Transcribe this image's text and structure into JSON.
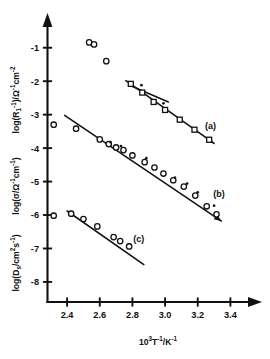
{
  "figure": {
    "title": "",
    "background": "#ffffff",
    "ink_color": "#111111"
  },
  "xaxis": {
    "label_parts": {
      "base1": "10",
      "exp1": "3",
      "base2": "T",
      "exp2": "-1",
      "slash": "/K",
      "exp3": "-1"
    },
    "label_plain": "10^3 T^-1 / K^-1",
    "ticks": [
      "2.4",
      "2.6",
      "2.8",
      "3.0",
      "3.2",
      "3.4"
    ],
    "tick_values": [
      2.4,
      2.6,
      2.8,
      3.0,
      3.2,
      3.4
    ],
    "range": [
      2.28,
      3.52
    ],
    "arrow": true
  },
  "yaxis": {
    "ticks": [
      "-1",
      "-2",
      "-3",
      "-4",
      "-5",
      "-6",
      "-7",
      "-8"
    ],
    "tick_values": [
      -1,
      -2,
      -3,
      -4,
      -5,
      -6,
      -7,
      -8
    ],
    "range": [
      -8.6,
      -0.35
    ],
    "arrow": true,
    "labels": [
      {
        "name": "log-R1-inverse",
        "plain": "log(R1^-1)/ohm^-1 cm^-2",
        "parts": [
          "log(R",
          "1",
          "-1",
          ")/",
          "Ω",
          "-1",
          "cm",
          "-2"
        ],
        "applies_to": "(a)"
      },
      {
        "name": "log-sigma",
        "plain": "log(sigma/ohm^-1 cm^-1)",
        "parts": [
          "log(",
          "σ",
          "/",
          "Ω",
          "-1",
          "cm",
          "-1",
          ")"
        ],
        "applies_to": "(b)"
      },
      {
        "name": "log-Ds",
        "plain": "log(Ds/cm^2 s^-1)",
        "parts": [
          "log(D",
          "s",
          "/cm",
          "2",
          "s",
          "-1",
          ")"
        ],
        "applies_to": "(c)"
      }
    ]
  },
  "chart_data": {
    "type": "scatter",
    "title": "",
    "xlabel": "10^3 T^-1 / K^-1",
    "ylabel": "log(R1^-1)/ohm^-1cm^-2 ; log(sigma/ohm^-1cm^-1) ; log(Ds/cm^2 s^-1)",
    "xlim": [
      2.28,
      3.52
    ],
    "ylim": [
      -8.6,
      -0.35
    ],
    "grid": false,
    "legend": "inline-curve-labels",
    "xticks": [
      2.4,
      2.6,
      2.8,
      3.0,
      3.2,
      3.4
    ],
    "yticks": [
      -1,
      -2,
      -3,
      -4,
      -5,
      -6,
      -7,
      -8
    ],
    "series": [
      {
        "name": "(a)",
        "label": "(a)",
        "marker": "open-square",
        "ylabel_ref": "log(R1^-1)/ohm^-1cm^-2",
        "points": [
          {
            "x": 2.79,
            "y": -2.08
          },
          {
            "x": 2.86,
            "y": -2.34
          },
          {
            "x": 2.93,
            "y": -2.62
          },
          {
            "x": 3.0,
            "y": -2.86
          },
          {
            "x": 3.09,
            "y": -3.15
          },
          {
            "x": 3.18,
            "y": -3.45
          },
          {
            "x": 3.27,
            "y": -3.75
          }
        ],
        "secondary_points": [
          {
            "x": 2.855,
            "y": -2.12
          },
          {
            "x": 2.99,
            "y": -2.66
          }
        ],
        "fit_line": {
          "x1": 2.76,
          "y1": -1.98,
          "x2": 3.3,
          "y2": -3.86
        },
        "short_line": {
          "x1": 2.8,
          "y1": -2.16,
          "x2": 3.02,
          "y2": -2.62
        },
        "label_pos": {
          "x": 3.245,
          "y": -3.42
        },
        "arrow_end": true
      },
      {
        "name": "(b)",
        "label": "(b)",
        "marker": "open-circle",
        "ylabel_ref": "log(sigma/ohm^-1cm^-1)",
        "points": [
          {
            "x": 2.455,
            "y": -3.42
          },
          {
            "x": 2.6,
            "y": -3.74
          },
          {
            "x": 2.655,
            "y": -3.88
          },
          {
            "x": 2.7,
            "y": -3.98
          },
          {
            "x": 2.745,
            "y": -4.06
          },
          {
            "x": 2.8,
            "y": -4.22
          },
          {
            "x": 2.875,
            "y": -4.42
          },
          {
            "x": 2.935,
            "y": -4.58
          },
          {
            "x": 2.99,
            "y": -4.76
          },
          {
            "x": 3.05,
            "y": -4.96
          },
          {
            "x": 3.115,
            "y": -5.15
          },
          {
            "x": 3.185,
            "y": -5.42
          },
          {
            "x": 3.255,
            "y": -5.74
          },
          {
            "x": 3.315,
            "y": -5.98
          }
        ],
        "secondary_points": [
          {
            "x": 2.665,
            "y": -3.82
          },
          {
            "x": 2.73,
            "y": -3.94
          },
          {
            "x": 2.885,
            "y": -4.3
          },
          {
            "x": 3.06,
            "y": -4.88
          },
          {
            "x": 3.135,
            "y": -5.06
          },
          {
            "x": 3.2,
            "y": -5.32
          },
          {
            "x": 3.3,
            "y": -5.72
          }
        ],
        "fit_line": {
          "x1": 2.385,
          "y1": -3.02,
          "x2": 3.345,
          "y2": -6.18
        },
        "label_pos": {
          "x": 3.295,
          "y": -5.46
        },
        "arrow_end": true
      },
      {
        "name": "(c)",
        "label": "(c)",
        "marker": "open-circle",
        "ylabel_ref": "log(Ds/cm^2 s^-1)",
        "points": [
          {
            "x": 2.425,
            "y": -5.96
          },
          {
            "x": 2.5,
            "y": -6.12
          },
          {
            "x": 2.585,
            "y": -6.34
          },
          {
            "x": 2.685,
            "y": -6.66
          },
          {
            "x": 2.725,
            "y": -6.78
          },
          {
            "x": 2.78,
            "y": -6.94
          }
        ],
        "secondary_points": [],
        "fit_line": {
          "x1": 2.4,
          "y1": -5.88,
          "x2": 2.87,
          "y2": -7.48
        },
        "label_pos": {
          "x": 2.805,
          "y": -6.8
        },
        "arrow_end": false
      },
      {
        "name": "outliers",
        "label": "",
        "marker": "open-circle",
        "ylabel_ref": "log(R1^-1)/ohm^-1cm^-2",
        "points": [
          {
            "x": 2.535,
            "y": -0.84
          },
          {
            "x": 2.565,
            "y": -0.9
          },
          {
            "x": 2.64,
            "y": -1.4
          }
        ],
        "secondary_points": [],
        "fit_line": null,
        "label_pos": null,
        "arrow_end": false
      },
      {
        "name": "axis-marks",
        "label": "",
        "marker": "open-circle",
        "ylabel_ref": "",
        "points": [
          {
            "x": 2.318,
            "y": -3.3
          },
          {
            "x": 2.318,
            "y": -6.02
          }
        ],
        "secondary_points": [],
        "fit_line": null,
        "label_pos": null,
        "arrow_end": false
      }
    ],
    "annotations": [
      {
        "text": "(a)",
        "x": 3.245,
        "y": -3.42
      },
      {
        "text": "(b)",
        "x": 3.295,
        "y": -5.46
      },
      {
        "text": "(c)",
        "x": 2.805,
        "y": -6.8
      }
    ]
  }
}
